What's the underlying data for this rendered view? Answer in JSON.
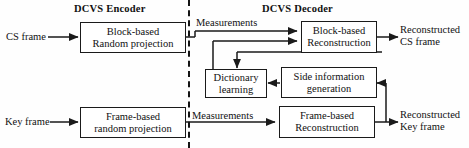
{
  "figure": {
    "type": "block-diagram",
    "titles": {
      "encoder": "DCVS Encoder",
      "decoder": "DCVS Decoder"
    },
    "divider": {
      "style": "dashed-vertical",
      "color": "#151515"
    },
    "blocks": {
      "block_random_projection": {
        "line1": "Block-based",
        "line2": "Random projection"
      },
      "frame_random_projection": {
        "line1": "Frame-based",
        "line2": "random projection"
      },
      "block_reconstruction": {
        "line1": "Block-based",
        "line2": "Reconstruction"
      },
      "frame_reconstruction": {
        "line1": "Frame-based",
        "line2": "Reconstruction"
      },
      "dictionary_learning": {
        "line1": "Dictionary",
        "line2": "learning"
      },
      "side_information": {
        "line1": "Side information",
        "line2": "generation"
      }
    },
    "io_labels": {
      "cs_frame_in": "CS frame",
      "key_frame_in": "Key frame",
      "measurements_top": "Measurements",
      "measurements_bottom": "Measurements",
      "reconstructed_cs_l1": "Reconstructed",
      "reconstructed_cs_l2": "CS frame",
      "reconstructed_key_l1": "Reconstructed",
      "reconstructed_key_l2": "Key frame"
    },
    "colors": {
      "stroke": "#1a1a1a",
      "text": "#111111",
      "background": "#fefefe"
    }
  }
}
